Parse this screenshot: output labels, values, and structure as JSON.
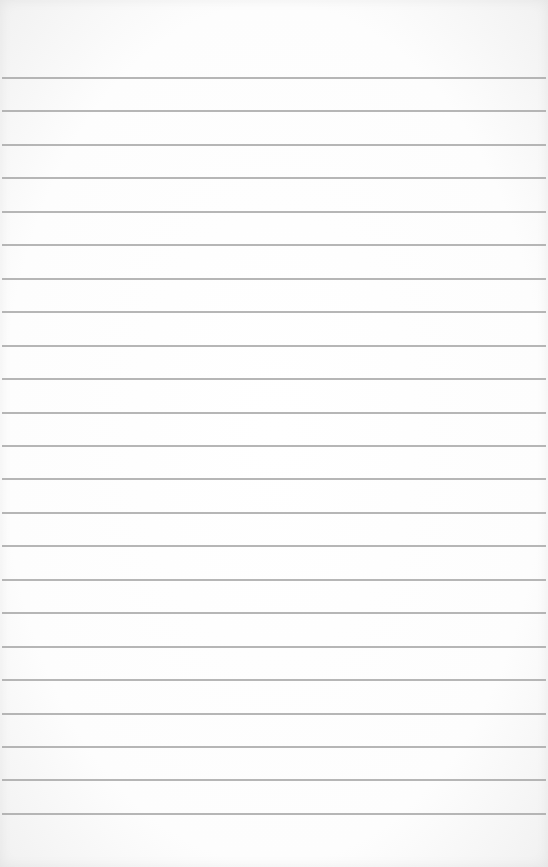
{
  "paper": {
    "type": "ruled-notepad-page",
    "background_color": "#ffffff",
    "rule_color": "#a9a9a9",
    "rule_count": 23,
    "first_rule_y": 77,
    "rule_spacing": 33.45,
    "text": ""
  }
}
